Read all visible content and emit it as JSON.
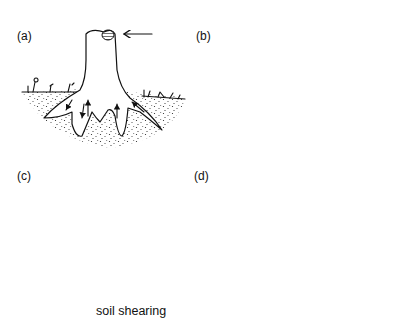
{
  "figure": {
    "panels": [
      {
        "id": "a",
        "label": "(a)",
        "description": "Upright stump with wind force arrow pushing from the right"
      },
      {
        "id": "b",
        "label": "(b)",
        "description": "Stump tilting left, roots lifting from the soil"
      },
      {
        "id": "c",
        "label": "(c)",
        "description": "Stump rotating further, root plate lifting with soil shearing"
      },
      {
        "id": "d",
        "label": "(d)",
        "description": "Stump fallen over with upturned root plate"
      }
    ],
    "annotations": {
      "soil_shearing": "soil shearing"
    },
    "colors": {
      "ink": "#111111",
      "background": "#ffffff"
    }
  }
}
